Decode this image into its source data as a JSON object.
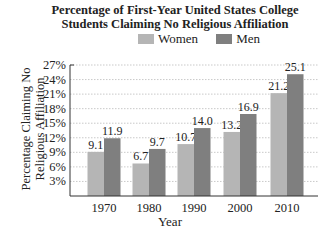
{
  "chart_data": {
    "type": "bar",
    "title_lines": [
      "Percentage of First-Year United States College",
      "Students Claiming No Religious Affiliation"
    ],
    "xlabel": "Year",
    "ylabel": "Percentage Claiming No Religious Affiliation",
    "ylabel_lines": [
      "Percentage Claiming No",
      "Religious Affiliation"
    ],
    "categories": [
      "1970",
      "1980",
      "1990",
      "2000",
      "2010"
    ],
    "series": [
      {
        "name": "Women",
        "color": "#b5b5b5",
        "values": [
          9.1,
          6.7,
          10.7,
          13.2,
          21.2
        ],
        "labels": [
          "9.1",
          "6.7",
          "10.7",
          "13.2",
          "21.2"
        ]
      },
      {
        "name": "Men",
        "color": "#7f7f7f",
        "values": [
          11.9,
          9.7,
          14.0,
          16.9,
          25.1
        ],
        "labels": [
          "11.9",
          "9.7",
          "14.0",
          "16.9",
          "25.1"
        ]
      }
    ],
    "yticks": [
      "3%",
      "6%",
      "9%",
      "12%",
      "15%",
      "18%",
      "21%",
      "24%",
      "27%"
    ],
    "ytick_values": [
      3,
      6,
      9,
      12,
      15,
      18,
      21,
      24,
      27
    ],
    "ylim": [
      0,
      27
    ],
    "grid": true,
    "legend_position": "top"
  }
}
